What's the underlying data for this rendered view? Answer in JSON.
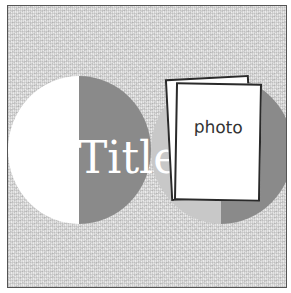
{
  "layout": {
    "title_text": "Title",
    "photo_placeholder_label": "photo"
  },
  "colors": {
    "background_texture": "#e4e4e4",
    "frame_border": "#555555",
    "semicircle_white": "#ffffff",
    "semicircle_dark": "#8a8a8a",
    "semicircle_light": "#c8c8c8",
    "title_text": "#ffffff",
    "card_border": "#2a2a2a"
  },
  "shapes": [
    {
      "name": "white-left-half-circle",
      "color": "#ffffff"
    },
    {
      "name": "dark-right-half-circle",
      "color": "#8a8a8a"
    },
    {
      "name": "light-left-half-circle",
      "color": "#c8c8c8"
    },
    {
      "name": "dark-right-half-circle-2",
      "color": "#8a8a8a"
    }
  ]
}
